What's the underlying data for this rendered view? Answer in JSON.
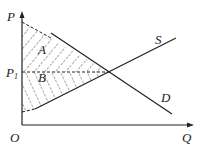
{
  "diagram": {
    "type": "supply-demand",
    "axes": {
      "y_label": "P",
      "x_label": "Q",
      "origin_label": "O"
    },
    "price_level": {
      "label": "P",
      "subscript": "1"
    },
    "curves": {
      "supply": "S",
      "demand": "D"
    },
    "regions": {
      "consumer_surplus": "A",
      "producer_surplus": "B"
    },
    "colors": {
      "line": "#222222",
      "background": "#ffffff"
    }
  }
}
